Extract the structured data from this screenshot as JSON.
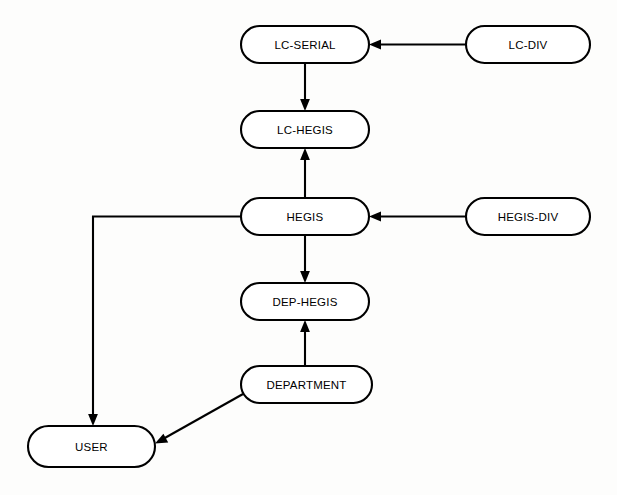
{
  "diagram": {
    "type": "flowchart",
    "background_color": "#fdfdfc",
    "node_fill": "#ffffff",
    "node_stroke": "#000000",
    "edge_color": "#000000",
    "nodes": [
      {
        "id": "lc-serial",
        "label": "LC-SERIAL",
        "shape": "stadium",
        "x": 241,
        "y": 26,
        "width": 128,
        "height": 37
      },
      {
        "id": "lc-div",
        "label": "LC-DIV",
        "shape": "stadium",
        "x": 466,
        "y": 26,
        "width": 124,
        "height": 37
      },
      {
        "id": "lc-hegis",
        "label": "LC-HEGIS",
        "shape": "stadium",
        "x": 241,
        "y": 111,
        "width": 128,
        "height": 37
      },
      {
        "id": "hegis",
        "label": "HEGIS",
        "shape": "stadium",
        "x": 241,
        "y": 198,
        "width": 128,
        "height": 37
      },
      {
        "id": "hegis-div",
        "label": "HEGIS-DIV",
        "shape": "stadium",
        "x": 466,
        "y": 198,
        "width": 124,
        "height": 37
      },
      {
        "id": "dep-hegis",
        "label": "DEP-HEGIS",
        "shape": "stadium",
        "x": 241,
        "y": 283,
        "width": 128,
        "height": 37
      },
      {
        "id": "department",
        "label": "DEPARTMENT",
        "shape": "stadium",
        "x": 241,
        "y": 366,
        "width": 131,
        "height": 37
      },
      {
        "id": "user",
        "label": "USER",
        "shape": "stadium",
        "x": 28,
        "y": 426,
        "width": 127,
        "height": 41
      }
    ],
    "edges": [
      {
        "id": "lc-div-to-lc-serial",
        "from": "lc-div",
        "to": "lc-serial",
        "direction": "left",
        "routing": "straight"
      },
      {
        "id": "lc-serial-to-lc-hegis",
        "from": "lc-serial",
        "to": "lc-hegis",
        "direction": "down",
        "routing": "straight"
      },
      {
        "id": "hegis-to-lc-hegis",
        "from": "hegis",
        "to": "lc-hegis",
        "direction": "up",
        "routing": "straight"
      },
      {
        "id": "hegis-div-to-hegis",
        "from": "hegis-div",
        "to": "hegis",
        "direction": "left",
        "routing": "straight"
      },
      {
        "id": "hegis-to-dep-hegis",
        "from": "hegis",
        "to": "dep-hegis",
        "direction": "down",
        "routing": "straight"
      },
      {
        "id": "department-to-dep-hegis",
        "from": "department",
        "to": "dep-hegis",
        "direction": "up",
        "routing": "straight"
      },
      {
        "id": "hegis-to-user",
        "from": "hegis",
        "to": "user",
        "direction": "down",
        "routing": "orthogonal"
      },
      {
        "id": "department-to-user",
        "from": "department",
        "to": "user",
        "direction": "diagonal",
        "routing": "straight"
      }
    ]
  }
}
